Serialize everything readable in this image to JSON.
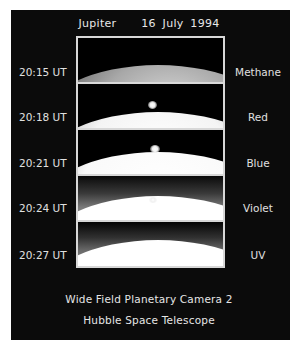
{
  "header": {
    "subject": "Jupiter",
    "date": "16 July 1994"
  },
  "frames": [
    {
      "time": "20:15 UT",
      "filter": "Methane",
      "spot": null
    },
    {
      "time": "20:18 UT",
      "filter": "Red",
      "spot": {
        "x": 74,
        "y": 20
      }
    },
    {
      "time": "20:21 UT",
      "filter": "Blue",
      "spot": {
        "x": 76,
        "y": 18
      }
    },
    {
      "time": "20:24 UT",
      "filter": "Violet",
      "spot": {
        "x": 74,
        "y": 24
      }
    },
    {
      "time": "20:27 UT",
      "filter": "UV",
      "spot": null
    }
  ],
  "caption": {
    "line1": "Wide Field Planetary Camera 2",
    "line2": "Hubble Space Telescope"
  },
  "colors": {
    "background": "#0b0b0b",
    "frame_border": "#d8d8d8",
    "text": "#e0e0e0"
  }
}
